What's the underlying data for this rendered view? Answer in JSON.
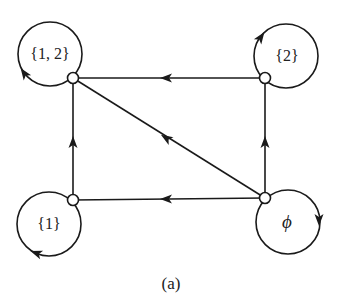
{
  "diagram": {
    "caption": "(a)",
    "colors": {
      "stroke": "#1a1a1a",
      "background": "#ffffff"
    },
    "nodes": [
      {
        "id": "s12",
        "label": "{1, 2}",
        "x": 73,
        "y": 78,
        "loop_cx": 50,
        "loop_cy": 54
      },
      {
        "id": "s2",
        "label": "{2}",
        "x": 265,
        "y": 78,
        "loop_cx": 286,
        "loop_cy": 56
      },
      {
        "id": "s1",
        "label": "{1}",
        "x": 73,
        "y": 200,
        "loop_cx": 49,
        "loop_cy": 224
      },
      {
        "id": "phi",
        "label": "ϕ",
        "x": 265,
        "y": 198,
        "loop_cx": 288,
        "loop_cy": 222
      }
    ],
    "edges": [
      {
        "from": "s2",
        "to": "s12",
        "direction": "leftward"
      },
      {
        "from": "s1",
        "to": "s12",
        "direction": "upward"
      },
      {
        "from": "phi",
        "to": "s12",
        "direction": "diagonal"
      },
      {
        "from": "phi",
        "to": "s2",
        "direction": "upward"
      },
      {
        "from": "phi",
        "to": "s1",
        "direction": "leftward"
      }
    ],
    "loops": [
      {
        "node": "s12",
        "arrow": "lower-left, pointing up"
      },
      {
        "node": "s2",
        "arrow": "upper-left, pointing up-right"
      },
      {
        "node": "s1",
        "arrow": "lower-left, pointing left"
      },
      {
        "node": "phi",
        "arrow": "right side, pointing down"
      }
    ]
  }
}
